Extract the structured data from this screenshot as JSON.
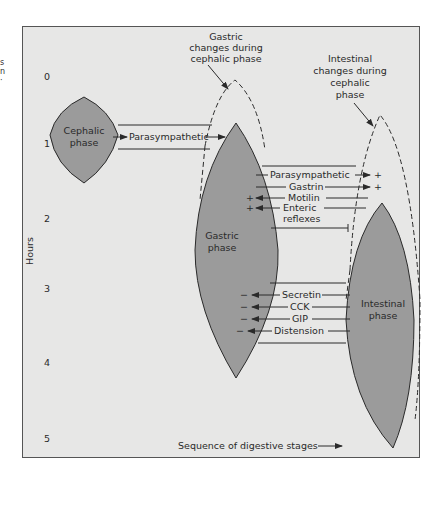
{
  "left_fragment": [
    "s",
    "n",
    "·"
  ],
  "y_axis": {
    "label": "Hours",
    "ticks": [
      "0",
      "1",
      "2",
      "3",
      "4",
      "5"
    ]
  },
  "x_axis": {
    "label": "Sequence of digestive stages"
  },
  "phases": {
    "cephalic": [
      "Cephalic",
      "phase"
    ],
    "gastric": [
      "Gastric",
      "phase"
    ],
    "intestinal": [
      "Intestinal",
      "phase"
    ]
  },
  "annotations": {
    "gastric_cephalic": [
      "Gastric",
      "changes during",
      "cephalic phase"
    ],
    "intestinal_cephalic": [
      "Intestinal",
      "changes during",
      "cephalic",
      "phase"
    ]
  },
  "signals": {
    "cephalic_to_gastric": "Parasympathetic",
    "gastric_to_intestinal": [
      {
        "label": "Parasympathetic",
        "effect": "+"
      },
      {
        "label": "Gastrin",
        "effect": "+"
      }
    ],
    "intestinal_to_gastric_stim": [
      {
        "label": "Motilin",
        "effect": "+"
      },
      {
        "label": "Enteric",
        "label2": "reflexes",
        "effect": "+"
      }
    ],
    "intestinal_to_gastric_inhib": [
      {
        "label": "Secretin",
        "effect": "−"
      },
      {
        "label": "CCK",
        "effect": "−"
      },
      {
        "label": "GIP",
        "effect": "−"
      },
      {
        "label": "Distension",
        "effect": "−"
      }
    ]
  },
  "colors": {
    "background": "#e7e7e6",
    "phase_fill": "#9b9b9b",
    "stroke": "#2a2a2a"
  }
}
